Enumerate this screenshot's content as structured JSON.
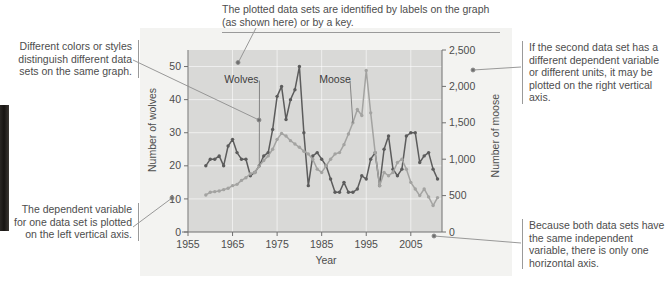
{
  "figure": {
    "notes": {
      "top": "The plotted data sets are identified by labels on the graph (as shown here) or by a key.",
      "left_top": "Different colors or styles distinguish different data sets on the same graph.",
      "left_bottom": "The dependent variable for one data set is plotted on the left vertical axis.",
      "right_top": "If the second data set has a different dependent variable or different units, it may be plotted on the right vertical axis.",
      "right_bottom": "Because both data sets have the same independent variable, there is only one horizontal axis."
    }
  },
  "chart_data": {
    "type": "line",
    "title": "",
    "xlabel": "Year",
    "ylabel": "Number of wolves",
    "y2label": "Number of moose",
    "xlim": [
      1955,
      2012
    ],
    "ylim": [
      0,
      55
    ],
    "y2lim": [
      0,
      2750
    ],
    "xticks": [
      1955,
      1965,
      1975,
      1985,
      1995,
      2005
    ],
    "yticks": [
      0,
      10,
      20,
      30,
      40,
      50
    ],
    "y2ticks": [
      "0",
      "500",
      "1,000",
      "1,500",
      "2,000",
      "2,500"
    ],
    "grid": true,
    "legend": "inline-labels",
    "plot_bgcolor": "#d9d9d7",
    "series": [
      {
        "name": "Wolves",
        "axis": "left",
        "color": "#5c5c5c",
        "label_x": 1967,
        "label_y": 45,
        "x": [
          1959,
          1960,
          1961,
          1962,
          1963,
          1964,
          1965,
          1966,
          1967,
          1968,
          1969,
          1970,
          1971,
          1972,
          1973,
          1974,
          1975,
          1976,
          1977,
          1978,
          1979,
          1980,
          1981,
          1982,
          1983,
          1984,
          1985,
          1986,
          1987,
          1988,
          1989,
          1990,
          1991,
          1992,
          1993,
          1994,
          1995,
          1996,
          1997,
          1998,
          1999,
          2000,
          2001,
          2002,
          2003,
          2004,
          2005,
          2006,
          2007,
          2008,
          2009,
          2010,
          2011
        ],
        "y": [
          20,
          22,
          22,
          23,
          20,
          26,
          28,
          24,
          22,
          22,
          17,
          18,
          20,
          23,
          24,
          31,
          41,
          44,
          34,
          40,
          43,
          50,
          30,
          14,
          23,
          24,
          22,
          20,
          16,
          12,
          12,
          15,
          12,
          12,
          13,
          17,
          16,
          22,
          24,
          14,
          25,
          29,
          19,
          17,
          19,
          29,
          30,
          30,
          21,
          23,
          24,
          19,
          16
        ]
      },
      {
        "name": "Moose",
        "axis": "right",
        "color": "#a3a3a1",
        "label_x": 1988,
        "label_y": 45,
        "x": [
          1959,
          1960,
          1961,
          1962,
          1963,
          1964,
          1965,
          1966,
          1967,
          1968,
          1969,
          1970,
          1971,
          1972,
          1973,
          1974,
          1975,
          1976,
          1977,
          1978,
          1979,
          1980,
          1981,
          1982,
          1983,
          1984,
          1985,
          1986,
          1987,
          1988,
          1989,
          1990,
          1991,
          1992,
          1993,
          1994,
          1995,
          1996,
          1997,
          1998,
          1999,
          2000,
          2001,
          2002,
          2003,
          2004,
          2005,
          2006,
          2007,
          2008,
          2009,
          2010,
          2011
        ],
        "y": [
          560,
          600,
          610,
          620,
          640,
          660,
          700,
          720,
          780,
          820,
          880,
          900,
          1000,
          1080,
          1150,
          1250,
          1400,
          1490,
          1450,
          1380,
          1330,
          1280,
          1220,
          1180,
          1100,
          950,
          900,
          1000,
          1100,
          1180,
          1200,
          1320,
          1480,
          1650,
          1850,
          1760,
          2440,
          1800,
          1200,
          700,
          900,
          850,
          900,
          1050,
          1100,
          950,
          750,
          650,
          550,
          650,
          530,
          400,
          520
        ]
      }
    ]
  }
}
